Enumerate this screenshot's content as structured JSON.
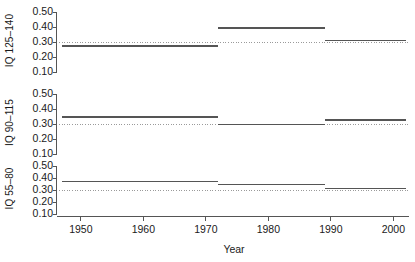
{
  "chart_data": {
    "type": "line",
    "title": "",
    "subtitle": "",
    "xlabel": "Year",
    "ylabel": "",
    "grid": false,
    "legend": "none",
    "xlim": [
      1946.5,
      2002.5
    ],
    "ylim": [
      0.085,
      0.515
    ],
    "x_ticks": [
      1950,
      1960,
      1970,
      1980,
      1990,
      2000
    ],
    "x_tick_labels": [
      "1950",
      "1960",
      "1970",
      "1980",
      "1990",
      "2000"
    ],
    "y_ticks": [
      0.1,
      0.2,
      0.3,
      0.4,
      0.5
    ],
    "y_tick_labels": [
      "0.10",
      "0.20",
      "0.30",
      "0.40",
      "0.50"
    ],
    "reference_line": {
      "value": 0.3,
      "style": "dotted",
      "color": "#9a9a9a"
    },
    "break_years": [
      1972,
      1989
    ],
    "panels": [
      {
        "id": "iq-125-140",
        "ylabel": "IQ 125–140",
        "series": [
          {
            "name": "IQ 125–140",
            "segments": [
              {
                "x_start": 1947.0,
                "x_end": 1972.0,
                "value": 0.275
              },
              {
                "x_start": 1972.0,
                "x_end": 1989.0,
                "value": 0.395
              },
              {
                "x_start": 1989.0,
                "x_end": 2002.0,
                "value": 0.31
              }
            ]
          }
        ]
      },
      {
        "id": "iq-90-115",
        "ylabel": "IQ 90–115",
        "series": [
          {
            "name": "IQ 90–115",
            "segments": [
              {
                "x_start": 1947.0,
                "x_end": 1972.0,
                "value": 0.345
              },
              {
                "x_start": 1972.0,
                "x_end": 1989.0,
                "value": 0.298
              },
              {
                "x_start": 1989.0,
                "x_end": 2002.0,
                "value": 0.327
              }
            ]
          }
        ]
      },
      {
        "id": "iq-55-80",
        "ylabel": "IQ 55–80",
        "series": [
          {
            "name": "IQ 55–80",
            "segments": [
              {
                "x_start": 1947.0,
                "x_end": 1972.0,
                "value": 0.372
              },
              {
                "x_start": 1972.0,
                "x_end": 1989.0,
                "value": 0.345
              },
              {
                "x_start": 1989.0,
                "x_end": 2002.0,
                "value": 0.312
              }
            ]
          }
        ]
      }
    ]
  },
  "colors": {
    "line": "#555555",
    "axis": "#555555",
    "reference": "#9a9a9a",
    "text": "#1a1a1a",
    "background": "#ffffff"
  }
}
